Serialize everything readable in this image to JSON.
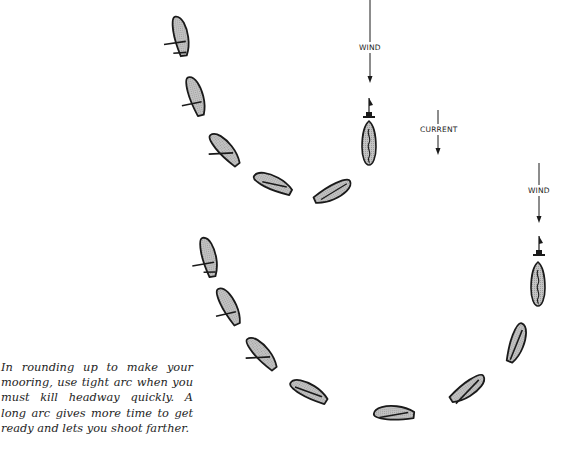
{
  "diagram": {
    "caption": "In rounding up to make your mooring, use tight arc when you must kill headway quickly. A long arc gives more time to get ready and lets you shoot farther.",
    "labels": {
      "wind_top": "WIND",
      "current": "CURRENT",
      "wind_right": "WIND"
    },
    "colors": {
      "boat_fill": "#b8b8b8",
      "outline": "#1a1a1a",
      "background": "#ffffff"
    },
    "arcs": [
      {
        "name": "tight-arc",
        "boat_count": 5,
        "mooring": "buoy with moored boat at top center"
      },
      {
        "name": "long-arc",
        "boat_count": 7,
        "mooring": "buoy with moored boat at right"
      }
    ]
  }
}
